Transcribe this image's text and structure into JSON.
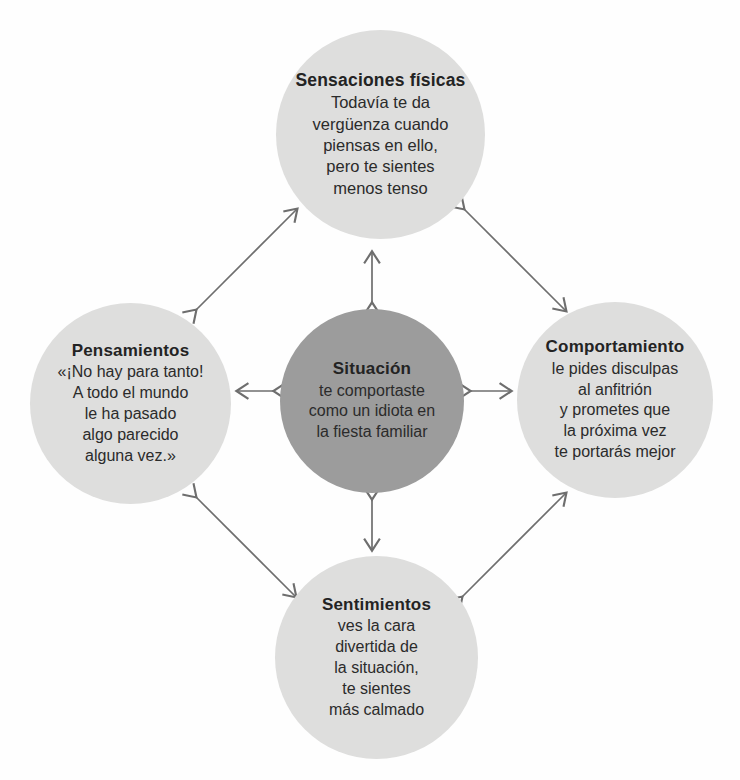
{
  "diagram": {
    "type": "cbt-hot-cross-bun",
    "language": "es",
    "background_color": "#fefefe",
    "satellite_color": "#dededd",
    "center_color": "#9c9c9c",
    "arrow_color": "#6e6e6e",
    "nodes": {
      "center": {
        "title": "Situación",
        "lines": [
          "te comportaste",
          "como un idiota en",
          "la fiesta familiar"
        ]
      },
      "top": {
        "title": "Sensaciones físicas",
        "lines": [
          "Todavía te da",
          "vergüenza cuando",
          "piensas en ello,",
          "pero te sientes",
          "menos tenso"
        ]
      },
      "left": {
        "title": "Pensamientos",
        "lines": [
          "«¡No hay para tanto!",
          "A todo el mundo",
          "le ha pasado",
          "algo parecido",
          "alguna vez.»"
        ]
      },
      "right": {
        "title": "Comportamiento",
        "lines": [
          "le pides disculpas",
          "al anfitrión",
          "y prometes que",
          "la próxima vez",
          "te portarás mejor"
        ]
      },
      "bottom": {
        "title": "Sentimientos",
        "lines": [
          "ves la cara",
          "divertida de",
          "la situación,",
          "te sientes",
          "más calmado"
        ]
      }
    },
    "connectors": [
      {
        "name": "center-top",
        "from": "center",
        "to": "top",
        "style": "double-headed"
      },
      {
        "name": "center-bottom",
        "from": "center",
        "to": "bottom",
        "style": "double-headed"
      },
      {
        "name": "center-left",
        "from": "center",
        "to": "left",
        "style": "double-headed"
      },
      {
        "name": "center-right",
        "from": "center",
        "to": "right",
        "style": "double-headed"
      },
      {
        "name": "left-top",
        "from": "left",
        "to": "top",
        "style": "double-headed"
      },
      {
        "name": "top-right",
        "from": "top",
        "to": "right",
        "style": "double-headed"
      },
      {
        "name": "left-bottom",
        "from": "left",
        "to": "bottom",
        "style": "double-headed"
      },
      {
        "name": "bottom-right",
        "from": "bottom",
        "to": "right",
        "style": "double-headed"
      }
    ]
  }
}
